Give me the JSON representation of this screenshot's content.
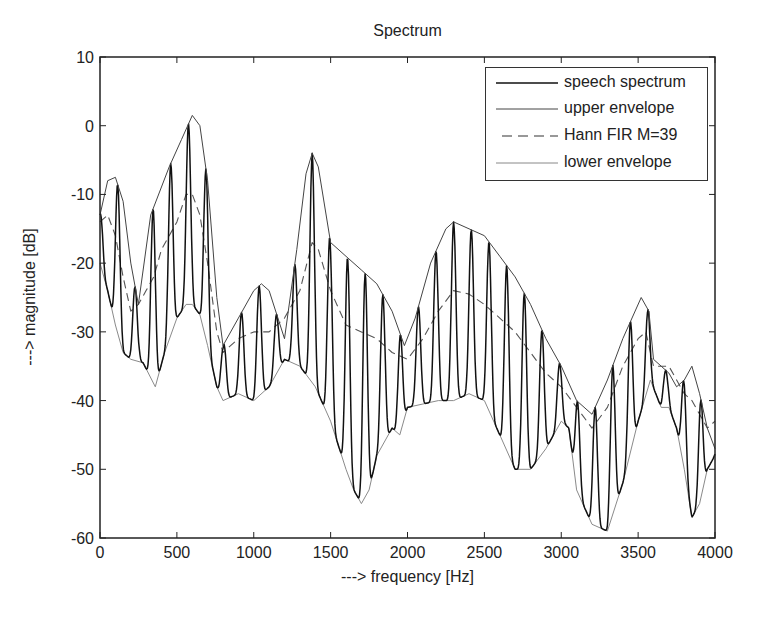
{
  "chart_data": {
    "type": "line",
    "title": "Spectrum",
    "xlabel": "---> frequency [Hz]",
    "ylabel": "---> magnitude [dB]",
    "xlim": [
      0,
      4000
    ],
    "ylim": [
      -60,
      10
    ],
    "xticks": [
      0,
      500,
      1000,
      1500,
      2000,
      2500,
      3000,
      3500,
      4000
    ],
    "yticks": [
      10,
      0,
      -10,
      -20,
      -30,
      -40,
      -50,
      -60
    ],
    "grid": false,
    "legend_position": "upper right",
    "legend": [
      "speech spectrum",
      "upper envelope",
      "Hann FIR M=39",
      "lower envelope"
    ],
    "pitch_hz": 115,
    "series": [
      {
        "name": "upper envelope",
        "style": "solid-thin",
        "x": [
          0,
          50,
          100,
          150,
          200,
          250,
          330,
          450,
          530,
          600,
          650,
          700,
          760,
          800,
          900,
          1000,
          1050,
          1100,
          1200,
          1280,
          1340,
          1380,
          1420,
          1500,
          1600,
          1700,
          1800,
          1900,
          1980,
          2050,
          2150,
          2250,
          2300,
          2400,
          2500,
          2600,
          2700,
          2800,
          2900,
          3000,
          3100,
          3200,
          3300,
          3400,
          3520,
          3570,
          3600,
          3650,
          3700,
          3750,
          3800,
          3850,
          3900,
          3950,
          4000
        ],
        "y": [
          -13,
          -8,
          -7.5,
          -11,
          -20,
          -26,
          -13,
          -6,
          -2,
          1.5,
          0,
          -8,
          -25,
          -32,
          -28,
          -24,
          -23,
          -24,
          -31,
          -18,
          -7,
          -4,
          -6,
          -17,
          -19,
          -21,
          -23,
          -27,
          -32,
          -28,
          -20,
          -15,
          -14,
          -15,
          -16,
          -19,
          -22,
          -26,
          -31,
          -35,
          -40,
          -42,
          -37,
          -31,
          -25,
          -27,
          -34,
          -35,
          -36,
          -38,
          -37,
          -35,
          -39,
          -44,
          -47
        ]
      },
      {
        "name": "lower envelope",
        "style": "solid-light",
        "x": [
          0,
          50,
          100,
          150,
          200,
          280,
          360,
          420,
          500,
          560,
          600,
          650,
          700,
          760,
          800,
          900,
          1000,
          1100,
          1200,
          1300,
          1400,
          1500,
          1600,
          1650,
          1700,
          1750,
          1800,
          1900,
          1950,
          2000,
          2100,
          2200,
          2300,
          2400,
          2500,
          2600,
          2700,
          2800,
          2900,
          3000,
          3050,
          3100,
          3200,
          3300,
          3400,
          3500,
          3580,
          3650,
          3700,
          3750,
          3800,
          3850,
          3900,
          3950,
          4000
        ],
        "y": [
          -20,
          -24,
          -29,
          -33,
          -34,
          -34.5,
          -38,
          -33,
          -28,
          -26,
          -26,
          -27.5,
          -32,
          -38,
          -40,
          -39,
          -40,
          -38,
          -34,
          -35,
          -38,
          -43,
          -50,
          -53,
          -55,
          -53,
          -48,
          -44,
          -45,
          -41,
          -40.5,
          -40,
          -40,
          -39,
          -40,
          -45,
          -50,
          -50,
          -47,
          -43,
          -44,
          -53,
          -58,
          -59,
          -52,
          -43,
          -37,
          -41,
          -41,
          -44,
          -50,
          -57,
          -55,
          -50,
          -48
        ]
      },
      {
        "name": "Hann FIR M=39",
        "style": "dashed",
        "x": [
          0,
          50,
          100,
          150,
          200,
          250,
          300,
          350,
          400,
          450,
          500,
          560,
          600,
          650,
          700,
          760,
          800,
          900,
          1000,
          1100,
          1200,
          1300,
          1380,
          1420,
          1500,
          1600,
          1700,
          1800,
          1900,
          2000,
          2100,
          2200,
          2300,
          2400,
          2500,
          2600,
          2700,
          2800,
          2900,
          3000,
          3100,
          3200,
          3300,
          3400,
          3500,
          3550,
          3600,
          3700,
          3800,
          3850,
          3900,
          3950,
          4000
        ],
        "y": [
          -14,
          -13,
          -16,
          -22,
          -27,
          -26,
          -24,
          -22,
          -18,
          -16,
          -14,
          -10,
          -10,
          -13,
          -20,
          -30,
          -33,
          -31,
          -30,
          -30,
          -28,
          -24,
          -17,
          -18,
          -24,
          -29,
          -30,
          -31,
          -33,
          -34,
          -31,
          -27,
          -24,
          -24.5,
          -26,
          -28,
          -30,
          -33,
          -36,
          -38,
          -41,
          -44,
          -41,
          -35,
          -31,
          -30,
          -35,
          -35,
          -39,
          -40,
          -42,
          -44,
          -43
        ]
      },
      {
        "name": "speech spectrum",
        "style": "solid-thick",
        "description": "harmonic spectrum oscillating between lower and upper envelopes at pitch_hz spacing"
      }
    ]
  }
}
